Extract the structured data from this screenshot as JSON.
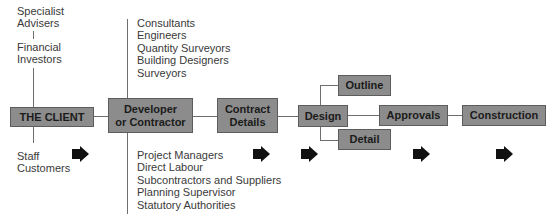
{
  "diagram": {
    "client_box": {
      "label": "THE CLIENT"
    },
    "client_above": {
      "group1": [
        "Specialist",
        "Advisers"
      ],
      "group2": [
        "Financial",
        "Investors"
      ]
    },
    "client_below": [
      "Staff",
      "Customers"
    ],
    "developer_box": {
      "line1": "Developer",
      "line2": "or Contractor"
    },
    "developer_above": [
      "Consultants",
      "Engineers",
      "Quantity Surveyors",
      "Building Designers",
      "Surveyors"
    ],
    "developer_below": [
      "Project Managers",
      "Direct Labour",
      "Subcontractors and Suppliers",
      "Planning Supervisor",
      "Statutory Authorities"
    ],
    "contract_box": {
      "line1": "Contract",
      "line2": "Details"
    },
    "design_box": {
      "label": "Design"
    },
    "outline_box": {
      "label": "Outline"
    },
    "detail_box": {
      "label": "Detail"
    },
    "approvals_box": {
      "label": "Approvals"
    },
    "construction_box": {
      "label": "Construction"
    },
    "arrows": [
      {
        "icon": "right-arrow-icon",
        "x": 72
      },
      {
        "icon": "right-arrow-icon",
        "x": 253
      },
      {
        "icon": "right-arrow-icon",
        "x": 301
      },
      {
        "icon": "right-arrow-icon",
        "x": 413
      },
      {
        "icon": "right-arrow-icon",
        "x": 496
      }
    ],
    "colors": {
      "box_fill": "#8c8c8c",
      "box_border": "#5c5c5c",
      "text": "#1b1b1b",
      "arrow": "#111111"
    }
  }
}
